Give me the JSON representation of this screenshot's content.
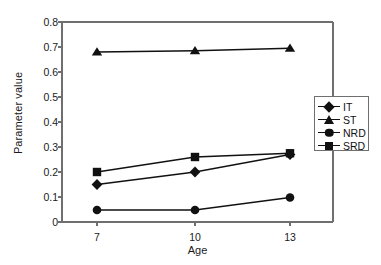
{
  "chart_data": {
    "type": "line",
    "title": "",
    "xlabel": "Age",
    "ylabel": "Parameter value",
    "x": [
      7,
      10,
      13
    ],
    "categories": [
      "7",
      "10",
      "13"
    ],
    "xlim": [
      5.5,
      14.5
    ],
    "ylim": [
      0,
      0.8
    ],
    "yticks": [
      "0",
      "0.1",
      "0.2",
      "0.3",
      "0.4",
      "0.5",
      "0.6",
      "0.7",
      "0.8"
    ],
    "ytick_values": [
      0,
      0.1,
      0.2,
      0.3,
      0.4,
      0.5,
      0.6,
      0.7,
      0.8
    ],
    "grid": false,
    "legend_position": "right-outside",
    "series": [
      {
        "name": "IT",
        "marker": "diamond",
        "values": [
          0.15,
          0.2,
          0.27
        ]
      },
      {
        "name": "ST",
        "marker": "triangle",
        "values": [
          0.68,
          0.685,
          0.695
        ]
      },
      {
        "name": "NRD",
        "marker": "circle",
        "values": [
          0.048,
          0.048,
          0.098
        ]
      },
      {
        "name": "SRD",
        "marker": "square",
        "values": [
          0.2,
          0.26,
          0.275
        ]
      }
    ],
    "colors": {
      "line": "#111111",
      "marker": "#111111",
      "axis": "#6f6f6f",
      "text": "#1a1a1a",
      "background": "#ffffff"
    }
  }
}
